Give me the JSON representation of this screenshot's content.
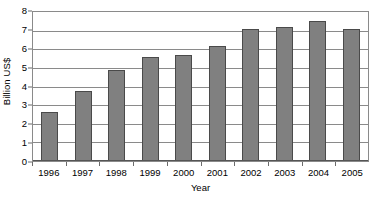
{
  "chart_data": {
    "type": "bar",
    "title": "",
    "xlabel": "Year",
    "ylabel": "Billion US$",
    "categories": [
      "1996",
      "1997",
      "1998",
      "1999",
      "2000",
      "2001",
      "2002",
      "2003",
      "2004",
      "2005"
    ],
    "values": [
      2.6,
      3.7,
      4.8,
      5.5,
      5.6,
      6.1,
      7.0,
      7.1,
      7.4,
      7.0
    ],
    "series": [
      {
        "name": "Billion US$",
        "values": [
          2.6,
          3.7,
          4.8,
          5.5,
          5.6,
          6.1,
          7.0,
          7.1,
          7.4,
          7.0
        ]
      }
    ],
    "ylim": [
      0,
      8
    ],
    "ytick_values": [
      0,
      1,
      2,
      3,
      4,
      5,
      6,
      7,
      8
    ],
    "ytick_labels": [
      "0",
      "1",
      "2",
      "3",
      "4",
      "5",
      "6",
      "7",
      "8"
    ],
    "grid": true,
    "grid_axis": "y",
    "legend": false,
    "legend_position": "none",
    "bar_color": "#808080",
    "bar_edge_color": "#4a4a4a",
    "grid_color": "#8a8a8a",
    "plot_background": "#ffffff",
    "text_color": "#000000"
  }
}
